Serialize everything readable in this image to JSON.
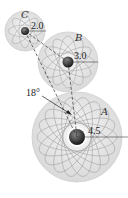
{
  "diagram": {
    "title": "",
    "gears": [
      {
        "label": "C",
        "radius_label": "2.0",
        "cx": 25,
        "cy": 31,
        "r": 20
      },
      {
        "label": "B",
        "radius_label": "3.0",
        "cx": 68,
        "cy": 62,
        "r": 30
      },
      {
        "label": "A",
        "radius_label": "4.5",
        "cx": 77,
        "cy": 137,
        "r": 45
      }
    ],
    "angle_label": "18°",
    "colors": {
      "gear_fill": "#e8e8e8",
      "gear_pattern": "#9a9a9a",
      "hub": "#3a3a3a",
      "line": "#333333"
    }
  }
}
